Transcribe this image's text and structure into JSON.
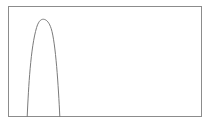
{
  "figure": {
    "background_color": "#ffffff",
    "width": 211,
    "height": 129
  },
  "frame": {
    "name": "plot-border",
    "x": 8.5,
    "y": 6.5,
    "width": 193,
    "height": 110,
    "stroke_color": "#8c8c8c",
    "stroke_width": 1,
    "fill_color": "#ffffff"
  },
  "curve": {
    "name": "peak-curve",
    "stroke_color": "#7a7a7a",
    "stroke_width": 1,
    "fill": "none",
    "path": "M 27.2 116.5 C 28.6 86 30.6 48 36.6 27.5 C 39.0 19.6 42.0 18.8 44.4 19.4 C 47.0 20.1 49.4 23.0 51.2 28.6 C 55.6 42.4 58.4 86 59.8 116.5"
  },
  "chart_data": {
    "type": "line",
    "title": "",
    "subtitle": "",
    "xlabel": "",
    "ylabel": "",
    "grid": false,
    "legend": false,
    "legend_position": "none",
    "axis_ticks": false,
    "axis_tick_labels": false,
    "xlim": [
      0,
      1
    ],
    "ylim": [
      0,
      1
    ],
    "series": [
      {
        "name": "peak",
        "color": "#7a7a7a",
        "x": [
          0.0,
          0.05,
          0.1,
          0.0968,
          0.11,
          0.13,
          0.15,
          0.17,
          0.1865,
          0.2,
          0.22,
          0.24,
          0.2653,
          0.28,
          0.3,
          0.32,
          0.34,
          0.36,
          0.38,
          0.4,
          0.5,
          0.6,
          0.7,
          0.8,
          0.9,
          1.0
        ],
        "y": [
          0.0,
          0.0,
          0.0,
          0.0,
          0.1,
          0.3,
          0.55,
          0.78,
          0.93,
          0.98,
          0.93,
          0.8,
          0.58,
          0.38,
          0.2,
          0.08,
          0.02,
          0.0,
          0.0,
          0.0,
          0.0,
          0.0,
          0.0,
          0.0,
          0.0,
          0.0
        ],
        "peak_x": 0.186,
        "peak_y": 0.98,
        "left_base_x": 0.097,
        "right_base_x": 0.265
      }
    ]
  }
}
